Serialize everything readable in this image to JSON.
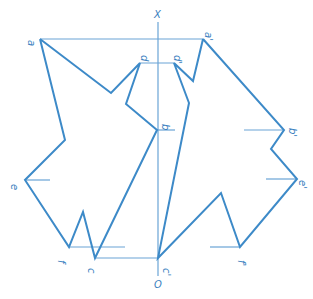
{
  "diagram": {
    "type": "descriptive-geometry-projection",
    "colors": {
      "line": "#3d8ac8",
      "thin": "#6aa4d6",
      "text": "#3b7fc0"
    },
    "axis": {
      "top_label": "X",
      "bottom_label": "O",
      "x": 158,
      "y_top": 12,
      "y_bottom": 276
    },
    "labels": [
      {
        "id": "a",
        "text": "a",
        "x": 28,
        "y": 40
      },
      {
        "id": "d",
        "text": "d",
        "x": 141,
        "y": 55
      },
      {
        "id": "b",
        "text": "b",
        "x": 162,
        "y": 124
      },
      {
        "id": "e",
        "text": "e",
        "x": 11,
        "y": 184
      },
      {
        "id": "f",
        "text": "f",
        "x": 58,
        "y": 260
      },
      {
        "id": "c",
        "text": "c",
        "x": 88,
        "y": 268
      },
      {
        "id": "a2",
        "text": "a'",
        "x": 205,
        "y": 32
      },
      {
        "id": "d2",
        "text": "d'",
        "x": 174,
        "y": 55
      },
      {
        "id": "b2",
        "text": "b'",
        "x": 289,
        "y": 128
      },
      {
        "id": "e2",
        "text": "e'",
        "x": 299,
        "y": 180
      },
      {
        "id": "f2",
        "text": "f'",
        "x": 238,
        "y": 260
      },
      {
        "id": "c2",
        "text": "c'",
        "x": 163,
        "y": 268
      }
    ],
    "shapes": [
      {
        "name": "left-figure",
        "points": "40,39 111,93 140,63 126,104 157,130 95,258 83,212 69,247 25,180 65,140 40,39"
      },
      {
        "name": "right-figure",
        "points": "203,39 193,81 174,63 189,103 158,258 221,193 240,247 297,179 271,149 284,130 203,39"
      }
    ],
    "construction_lines": [
      {
        "name": "a-line",
        "x1": 40,
        "y1": 39,
        "x2": 203,
        "y2": 39
      },
      {
        "name": "d-line",
        "x1": 140,
        "y1": 63,
        "x2": 174,
        "y2": 63
      },
      {
        "name": "b-line",
        "x1": 157,
        "y1": 130,
        "x2": 175,
        "y2": 130
      },
      {
        "name": "b2-line",
        "x1": 244,
        "y1": 130,
        "x2": 284,
        "y2": 130
      },
      {
        "name": "e-line",
        "x1": 25,
        "y1": 180,
        "x2": 50,
        "y2": 180
      },
      {
        "name": "e2-line",
        "x1": 266,
        "y1": 179,
        "x2": 297,
        "y2": 179
      },
      {
        "name": "f-line",
        "x1": 69,
        "y1": 247,
        "x2": 125,
        "y2": 247
      },
      {
        "name": "f2-line",
        "x1": 210,
        "y1": 247,
        "x2": 240,
        "y2": 247
      },
      {
        "name": "c-line",
        "x1": 95,
        "y1": 258,
        "x2": 158,
        "y2": 258
      }
    ]
  }
}
